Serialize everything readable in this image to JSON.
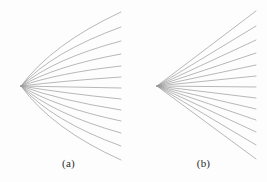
{
  "figure": {
    "background_color": "#fdfdfd",
    "width": 267,
    "height": 182,
    "stroke_color": "#9a9a9a",
    "label_color": "#2b2b2b"
  },
  "panels": [
    {
      "id": "a",
      "label": "(a)",
      "ray_style": "curved",
      "description": "curved ray bundle converging to a cusp",
      "vertex": {
        "x": 21,
        "y": 86
      },
      "ray_count": 13,
      "end_x": 121,
      "rays": [
        {
          "end_y": 12,
          "ctrl_x": 52,
          "ctrl_y": 44
        },
        {
          "end_y": 27,
          "ctrl_x": 52,
          "ctrl_y": 52
        },
        {
          "end_y": 41,
          "ctrl_x": 53,
          "ctrl_y": 59
        },
        {
          "end_y": 54,
          "ctrl_x": 55,
          "ctrl_y": 66
        },
        {
          "end_y": 66,
          "ctrl_x": 58,
          "ctrl_y": 73
        },
        {
          "end_y": 77,
          "ctrl_x": 62,
          "ctrl_y": 81
        },
        {
          "end_y": 88,
          "ctrl_x": 70,
          "ctrl_y": 87
        },
        {
          "end_y": 99,
          "ctrl_x": 62,
          "ctrl_y": 93
        },
        {
          "end_y": 110,
          "ctrl_x": 58,
          "ctrl_y": 100
        },
        {
          "end_y": 121,
          "ctrl_x": 55,
          "ctrl_y": 107
        },
        {
          "end_y": 133,
          "ctrl_x": 53,
          "ctrl_y": 114
        },
        {
          "end_y": 146,
          "ctrl_x": 52,
          "ctrl_y": 121
        },
        {
          "end_y": 160,
          "ctrl_x": 52,
          "ctrl_y": 129
        }
      ]
    },
    {
      "id": "b",
      "label": "(b)",
      "ray_style": "straight",
      "description": "straight rays radiating from a point focus",
      "vertex": {
        "x": 24,
        "y": 86
      },
      "ray_count": 13,
      "end_x": 123,
      "rays": [
        {
          "end_y": 11
        },
        {
          "end_y": 26
        },
        {
          "end_y": 40
        },
        {
          "end_y": 53
        },
        {
          "end_y": 65
        },
        {
          "end_y": 76
        },
        {
          "end_y": 87
        },
        {
          "end_y": 98
        },
        {
          "end_y": 109
        },
        {
          "end_y": 120
        },
        {
          "end_y": 132
        },
        {
          "end_y": 145
        },
        {
          "end_y": 159
        }
      ]
    }
  ]
}
